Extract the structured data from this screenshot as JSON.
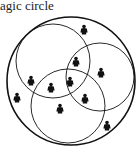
{
  "caption": "agic circle",
  "diagram": {
    "outer_circle": {
      "cx": 71,
      "cy": 81,
      "r": 64
    },
    "inner_circles": [
      {
        "name": "top-left",
        "cx": 53,
        "cy": 61,
        "r": 37
      },
      {
        "name": "right",
        "cx": 100,
        "cy": 77,
        "r": 34
      },
      {
        "name": "bottom",
        "cx": 68,
        "cy": 106,
        "r": 37
      }
    ],
    "figures": [
      {
        "x": 84,
        "y": 30
      },
      {
        "x": 76,
        "y": 62
      },
      {
        "x": 101,
        "y": 73
      },
      {
        "x": 31,
        "y": 81
      },
      {
        "x": 51,
        "y": 88
      },
      {
        "x": 70,
        "y": 82
      },
      {
        "x": 17,
        "y": 98
      },
      {
        "x": 85,
        "y": 99
      },
      {
        "x": 60,
        "y": 109
      },
      {
        "x": 107,
        "y": 126
      }
    ],
    "stroke_color": "#111111"
  }
}
